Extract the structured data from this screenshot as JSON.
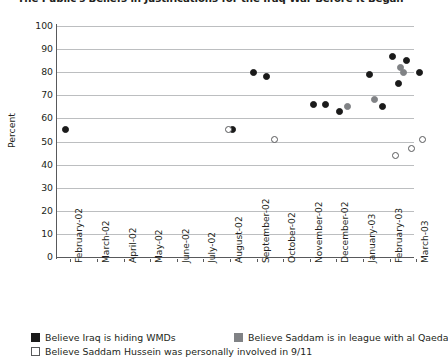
{
  "chart_data": {
    "type": "scatter",
    "title": "The Public's Beliefs in Justifications for the Iraq War Before It Began",
    "xlabel": "",
    "ylabel": "Percent",
    "ylim": [
      0,
      100
    ],
    "ytick_step": 10,
    "yticks": [
      "100",
      "90",
      "80",
      "70",
      "60",
      "50",
      "40",
      "30",
      "20",
      "10",
      "0"
    ],
    "grid": true,
    "legend_position": "bottom-left",
    "categories": [
      "February-02",
      "March-02",
      "April-02",
      "May-02",
      "June-02",
      "July-02",
      "August-02",
      "September-02",
      "October-02",
      "November-02",
      "December-02",
      "January-03",
      "February-03",
      "March-03"
    ],
    "series": [
      {
        "name": "Believe Iraq is hiding WMDs",
        "key": "wmd",
        "color": "#1a1a1a",
        "marker": "filled-circle",
        "points": [
          {
            "x": "February-02",
            "x_frac": 0.0,
            "y": 55
          },
          {
            "x": "August-02",
            "x_frac": 6.28,
            "y": 55
          },
          {
            "x": "September-02",
            "x_frac": 7.07,
            "y": 80
          },
          {
            "x": "September-02",
            "x_frac": 7.55,
            "y": 78
          },
          {
            "x": "November-02",
            "x_frac": 9.3,
            "y": 66
          },
          {
            "x": "November-02",
            "x_frac": 9.78,
            "y": 66
          },
          {
            "x": "December-02",
            "x_frac": 10.3,
            "y": 63
          },
          {
            "x": "January-03",
            "x_frac": 11.4,
            "y": 79
          },
          {
            "x": "January-03",
            "x_frac": 11.9,
            "y": 65
          },
          {
            "x": "February-03",
            "x_frac": 12.3,
            "y": 87
          },
          {
            "x": "February-03",
            "x_frac": 12.5,
            "y": 75
          },
          {
            "x": "February-03",
            "x_frac": 12.8,
            "y": 85
          },
          {
            "x": "March-03",
            "x_frac": 13.3,
            "y": 80
          }
        ]
      },
      {
        "name": "Believe Saddam is in league with al Qaeda",
        "key": "qaeda",
        "color": "#808285",
        "marker": "filled-circle",
        "points": [
          {
            "x": "December-02",
            "x_frac": 10.6,
            "y": 65
          },
          {
            "x": "January-03",
            "x_frac": 11.6,
            "y": 68
          },
          {
            "x": "February-03",
            "x_frac": 12.6,
            "y": 82
          },
          {
            "x": "February-03",
            "x_frac": 12.7,
            "y": 80
          }
        ]
      },
      {
        "name": "Believe Saddam Hussein was personally involved in 9/11",
        "key": "nineeleven",
        "color": "#ffffff",
        "marker": "open-circle",
        "points": [
          {
            "x": "August-02",
            "x_frac": 6.1,
            "y": 55
          },
          {
            "x": "September-02",
            "x_frac": 7.85,
            "y": 51
          },
          {
            "x": "February-03",
            "x_frac": 12.4,
            "y": 44
          },
          {
            "x": "March-03",
            "x_frac": 13.0,
            "y": 47
          },
          {
            "x": "March-03",
            "x_frac": 13.4,
            "y": 51
          }
        ]
      }
    ]
  },
  "legend": [
    {
      "label": "Believe Iraq is hiding WMDs",
      "key": "wmd"
    },
    {
      "label": "Believe Saddam is in league with al Qaeda",
      "key": "qaeda"
    },
    {
      "label": "Believe Saddam Hussein was personally involved in 9/11",
      "key": "nineeleven"
    }
  ]
}
